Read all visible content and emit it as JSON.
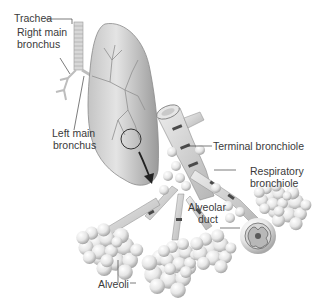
{
  "diagram": {
    "type": "anatomical-illustration",
    "labels": {
      "trachea": "Trachea",
      "right_main_bronchus_line1": "Right main",
      "right_main_bronchus_line2": "bronchus",
      "left_main_bronchus_line1": "Left main",
      "left_main_bronchus_line2": "bronchus",
      "terminal_bronchiole": "Terminal bronchiole",
      "respiratory_bronchiole_line1": "Respiratory",
      "respiratory_bronchiole_line2": "bronchiole",
      "alveolar_duct_line1": "Alveolar",
      "alveolar_duct_line2": "duct",
      "alveoli": "Alveoli"
    },
    "colors": {
      "background": "#ffffff",
      "lung_fill": "#d9d9d9",
      "lung_shade": "#a9a9a9",
      "tube": "#cfcfcf",
      "tube_band": "#555555",
      "alveoli": "#f2f2f2",
      "leader_line": "#444444",
      "arrow": "#222222"
    }
  }
}
